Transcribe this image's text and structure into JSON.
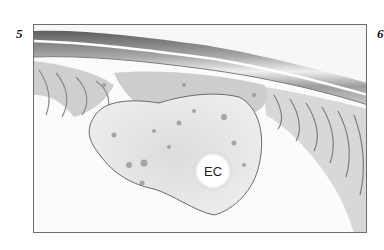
{
  "figure": {
    "panels": [
      {
        "label": "5"
      },
      {
        "label": "6"
      }
    ],
    "annotations": [
      {
        "text": "EC"
      }
    ],
    "colors": {
      "frame": "#6d6d6d",
      "tissue_dark": "#7a7a7a",
      "tissue_light": "#d8d8d8",
      "background": "#ffffff"
    }
  }
}
